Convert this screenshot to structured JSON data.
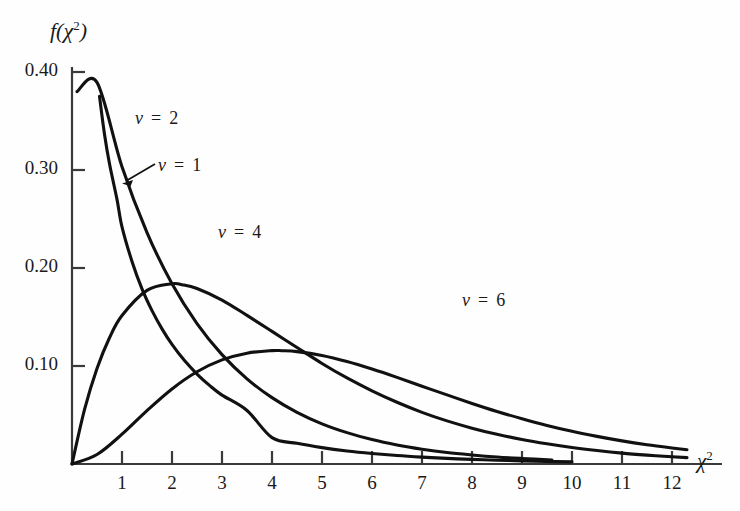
{
  "chart_data": {
    "type": "line",
    "title": "",
    "subtitle": "",
    "xlabel": "χ²",
    "ylabel": "f(χ²)",
    "xlim": [
      0,
      13.0
    ],
    "ylim": [
      0,
      0.405
    ],
    "grid": false,
    "legend_position": "inline-annotations",
    "x_ticks": [
      1,
      2,
      3,
      4,
      5,
      6,
      7,
      8,
      9,
      10,
      11,
      12
    ],
    "x_tick_labels": [
      "1",
      "2",
      "3",
      "4",
      "5",
      "6",
      "7",
      "8",
      "9",
      "10",
      "11",
      "12"
    ],
    "y_ticks": [
      0.1,
      0.2,
      0.3,
      0.4
    ],
    "y_tick_labels": [
      "0.10",
      "0.20",
      "0.30",
      "0.40"
    ],
    "curve_color": "#111111",
    "axis_color": "#3a3a3a",
    "series": [
      {
        "name": "ν = 1",
        "label": "ν  =  1",
        "nu": 1,
        "x": [
          0.55,
          0.65,
          0.75,
          0.9,
          1.0,
          1.2,
          1.4,
          1.6,
          1.8,
          2.0,
          2.25,
          2.5,
          2.75,
          3.0,
          3.5,
          4.0,
          4.5,
          5.0,
          5.5,
          6.0,
          6.5,
          7.0,
          7.5,
          8.0,
          8.5,
          9.0,
          9.5,
          10.0
        ],
        "y": [
          0.3752,
          0.3365,
          0.3063,
          0.27,
          0.242,
          0.2067,
          0.1787,
          0.1565,
          0.1379,
          0.122,
          0.1055,
          0.0918,
          0.0802,
          0.0703,
          0.0546,
          0.0269,
          0.0211,
          0.0167,
          0.0133,
          0.0107,
          0.0086,
          0.007,
          0.0057,
          0.0047,
          0.0038,
          0.0032,
          0.0026,
          0.0022
        ]
      },
      {
        "name": "ν = 2",
        "label": "ν  =  2",
        "nu": 2,
        "x": [
          0.1,
          0.5,
          1.0,
          1.5,
          2.0,
          2.5,
          3.0,
          3.5,
          4.0,
          4.5,
          5.0,
          5.5,
          6.0,
          6.5,
          7.0,
          7.5,
          8.0,
          8.5,
          9.0,
          9.6
        ],
        "y": [
          0.38,
          0.3894,
          0.3033,
          0.2362,
          0.1839,
          0.1433,
          0.1116,
          0.0869,
          0.0677,
          0.0527,
          0.041,
          0.032,
          0.0249,
          0.0194,
          0.0151,
          0.0117,
          0.0092,
          0.0071,
          0.0056,
          0.0041
        ]
      },
      {
        "name": "ν = 4",
        "label": "ν  =  4",
        "nu": 4,
        "x": [
          0.0,
          0.25,
          0.5,
          0.75,
          1.0,
          1.5,
          2.0,
          2.2,
          2.5,
          3.0,
          3.5,
          4.0,
          4.5,
          5.0,
          5.5,
          6.0,
          6.5,
          7.0,
          7.5,
          8.0,
          8.5,
          9.0,
          9.5,
          10.0,
          10.5,
          11.0,
          11.5,
          12.0,
          12.3
        ],
        "y": [
          0.0,
          0.0554,
          0.0974,
          0.1288,
          0.1516,
          0.1772,
          0.1839,
          0.183,
          0.1791,
          0.1673,
          0.1516,
          0.1353,
          0.1189,
          0.1026,
          0.0878,
          0.0747,
          0.063,
          0.0527,
          0.044,
          0.0366,
          0.0303,
          0.025,
          0.0206,
          0.0168,
          0.0137,
          0.0111,
          0.0091,
          0.0074,
          0.0065
        ]
      },
      {
        "name": "ν = 6",
        "label": "ν  =  6",
        "nu": 6,
        "x": [
          0.0,
          0.5,
          1.0,
          1.5,
          2.0,
          2.5,
          3.0,
          3.5,
          4.0,
          4.2,
          4.5,
          5.0,
          5.5,
          6.0,
          6.5,
          7.0,
          7.5,
          8.0,
          8.5,
          9.0,
          9.5,
          10.0,
          10.5,
          11.0,
          11.5,
          12.0,
          12.3
        ],
        "y": [
          0.0,
          0.0097,
          0.0304,
          0.0545,
          0.0766,
          0.0941,
          0.1062,
          0.1131,
          0.1157,
          0.1156,
          0.1147,
          0.1108,
          0.1046,
          0.0969,
          0.0884,
          0.0794,
          0.0705,
          0.0618,
          0.0536,
          0.0462,
          0.0394,
          0.0334,
          0.0282,
          0.0236,
          0.0197,
          0.0164,
          0.0146
        ]
      }
    ],
    "annotations": [
      {
        "name": "nu-1-arrow",
        "text": "ν  =  1",
        "label_x": 9999,
        "points_to_series": "ν = 1",
        "type": "arrow"
      }
    ]
  },
  "labels": {
    "y_axis_title_base": "f(χ",
    "y_axis_title_sup": "2",
    "y_axis_title_close": ")",
    "x_axis_title_base": "χ",
    "x_axis_title_sup": "2",
    "nu_symbol": "ν",
    "eq": "=",
    "nu1": "1",
    "nu2": "2",
    "nu4": "4",
    "nu6": "6"
  }
}
